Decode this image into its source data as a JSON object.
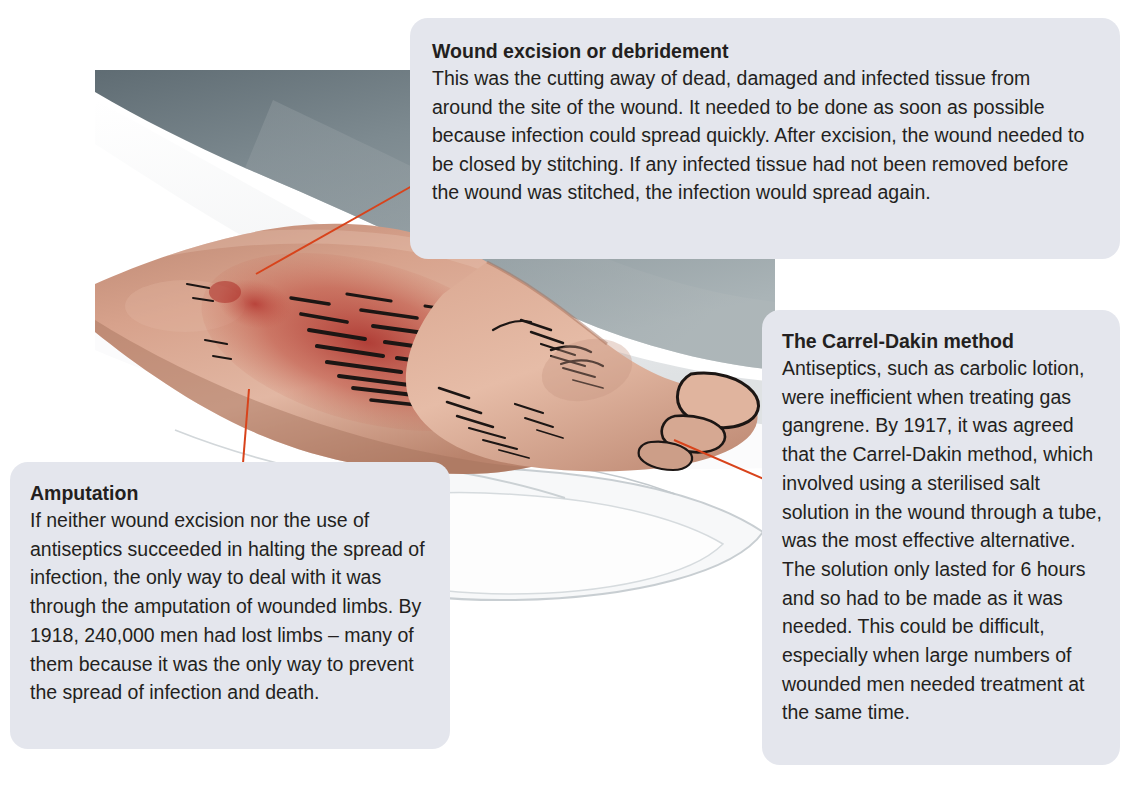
{
  "figure": {
    "alt_description": "Illustration of a wounded lower leg and foot resting on white hospital bedding with a grey-blue blanket, showing an infected laceration wound",
    "illustration_colors": {
      "blanket_grey_blue": "#8b969b",
      "blanket_dark": "#6f7a80",
      "sheet_white": "#fdfdfd",
      "sheet_shadow": "#c9ced2",
      "skin_light": "#e0b9a6",
      "skin_mid": "#cf9b86",
      "skin_shadow": "#a9705c",
      "wound_red": "#b5302a",
      "wound_deep_red": "#8e1f1c",
      "hatching_black": "#1b1b1b"
    }
  },
  "leader_lines": {
    "color": "#d8431b",
    "width_px": 2,
    "lines": [
      {
        "name": "leader-excision",
        "x1": 256,
        "y1": 274,
        "x2": 412,
        "y2": 186
      },
      {
        "name": "leader-amputation",
        "x1": 249,
        "y1": 389,
        "x2": 243,
        "y2": 463
      },
      {
        "name": "leader-carrel",
        "x1": 674,
        "y1": 440,
        "x2": 764,
        "y2": 479
      }
    ]
  },
  "callouts": [
    {
      "id": "excision",
      "title": "Wound excision or debridement",
      "body": "This was the cutting away of dead, damaged and infected tissue from around the site of the wound. It needed to be done as soon as possible because infection could spread quickly. After excision, the wound needed to be closed by stitching. If any infected tissue had not been removed before the wound was stitched, the infection would spread again."
    },
    {
      "id": "carrel",
      "title": "The Carrel-Dakin method",
      "body": "Antiseptics, such as carbolic lotion, were inefficient when treating gas gangrene. By 1917, it was agreed that the Carrel-Dakin method, which involved using a sterilised salt solution in the wound through a tube, was the most effective alternative. The solution only lasted for 6 hours and so had to be made as it was needed. This could be difficult, especially when large numbers of wounded men needed treatment at the same time."
    },
    {
      "id": "amputation",
      "title": "Amputation",
      "body": "If neither wound excision nor the use of antiseptics succeeded in halting the spread of infection, the only way to deal with it was through the amputation of wounded limbs. By 1918, 240,000 men had lost limbs – many of them because it was the only way to prevent the spread of infection and death."
    }
  ]
}
